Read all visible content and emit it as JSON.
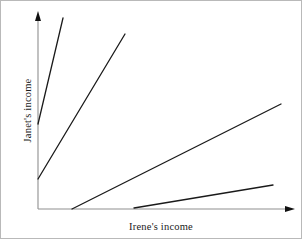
{
  "figure": {
    "background_color": "#ffffff",
    "border_color": "#b9b9b9",
    "width": 302,
    "height": 239
  },
  "axes": {
    "x_label": "Irene's income",
    "y_label": "Janet's income",
    "axis_color": "#8f8f8f",
    "arrow_color": "#111111",
    "origin": {
      "x": 37,
      "y": 208
    },
    "x_axis_end": {
      "x": 292,
      "y": 208
    },
    "y_axis_end": {
      "x": 37,
      "y": 12
    }
  },
  "chart_data": {
    "type": "line",
    "title": "",
    "xlabel": "Irene's income",
    "ylabel": "Janet's income",
    "xlim": [
      0,
      1
    ],
    "ylim": [
      0,
      1
    ],
    "grid": false,
    "legend": "none",
    "ticks": {
      "x": [],
      "y": []
    },
    "line_color": "#1a1a1a",
    "line_width": 1.3,
    "series": [
      {
        "name": "segment-1",
        "description": "steepest line starting on the vertical axis above the origin",
        "start": {
          "x": 37,
          "y": 123
        },
        "end": {
          "x": 62,
          "y": 17
        },
        "points_px": [
          [
            37,
            123
          ],
          [
            62,
            17
          ]
        ]
      },
      {
        "name": "segment-2",
        "description": "steep line starting on the vertical axis below segment 1",
        "start": {
          "x": 37,
          "y": 178
        },
        "end": {
          "x": 124,
          "y": 33
        },
        "points_px": [
          [
            37,
            178
          ],
          [
            124,
            33
          ]
        ]
      },
      {
        "name": "segment-3",
        "description": "long moderate slope line starting on the horizontal axis",
        "start": {
          "x": 71,
          "y": 208
        },
        "end": {
          "x": 280,
          "y": 103
        },
        "points_px": [
          [
            71,
            208
          ],
          [
            280,
            103
          ]
        ]
      },
      {
        "name": "segment-4",
        "description": "shallow slope line starting farthest right on the horizontal axis",
        "start": {
          "x": 133,
          "y": 207
        },
        "end": {
          "x": 272,
          "y": 184
        },
        "points_px": [
          [
            133,
            207
          ],
          [
            272,
            184
          ]
        ]
      }
    ]
  }
}
